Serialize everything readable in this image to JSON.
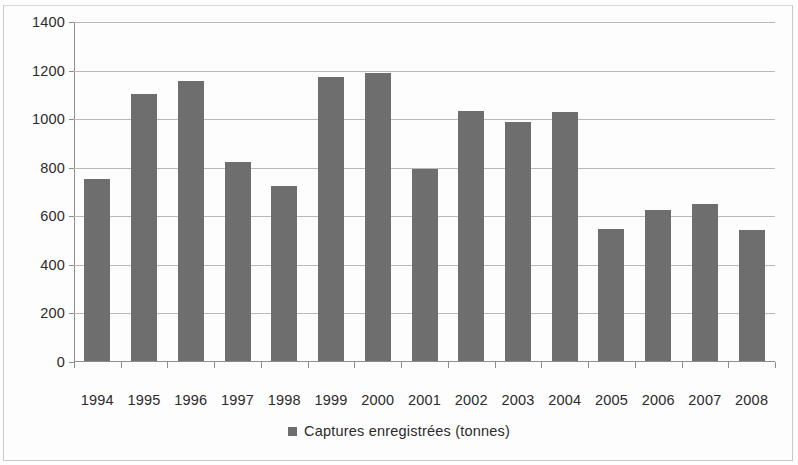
{
  "chart_data": {
    "type": "bar",
    "title": "",
    "subtitle": "",
    "xlabel": "",
    "ylabel": "",
    "categories": [
      "1994",
      "1995",
      "1996",
      "1997",
      "1998",
      "1999",
      "2000",
      "2001",
      "2002",
      "2003",
      "2004",
      "2005",
      "2006",
      "2007",
      "2008"
    ],
    "values": [
      750,
      1100,
      1155,
      820,
      720,
      1170,
      1185,
      790,
      1030,
      985,
      1025,
      545,
      620,
      645,
      540
    ],
    "series": [
      {
        "name": "Captures enregistrées (tonnes)",
        "values": [
          750,
          1100,
          1155,
          820,
          720,
          1170,
          1185,
          790,
          1030,
          985,
          1025,
          545,
          620,
          645,
          540
        ],
        "color": "#6e6e6e"
      }
    ],
    "ylim": [
      0,
      1400
    ],
    "ytick_values": [
      0,
      200,
      400,
      600,
      800,
      1000,
      1200,
      1400
    ],
    "ytick_labels": [
      "0",
      "200",
      "400",
      "600",
      "800",
      "1000",
      "1200",
      "1400"
    ],
    "grid": true,
    "grid_axis": "y",
    "legend": {
      "position": "bottom-center",
      "entries": [
        {
          "label": "Captures enregistrées (tonnes)",
          "marker": "square",
          "color": "#6e6e6e"
        }
      ]
    },
    "bar_color": "#6e6e6e",
    "background_color": "#fdfdfd",
    "gridline_color": "#b9b9b9",
    "axis_color": "#8d8d8d"
  }
}
